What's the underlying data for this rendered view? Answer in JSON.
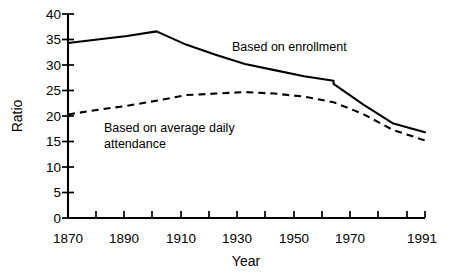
{
  "chart_data": {
    "type": "line",
    "title": "",
    "xlabel": "Year",
    "ylabel": "Ratio",
    "xlim": [
      1870,
      1991
    ],
    "ylim": [
      0,
      40
    ],
    "grid": false,
    "legend_position": "inline-annotations",
    "x_ticks_labeled": [
      "1870",
      "1890",
      "1910",
      "1930",
      "1950",
      "1970",
      "1991"
    ],
    "x_tick_values": [
      1870,
      1890,
      1910,
      1930,
      1950,
      1970,
      1991
    ],
    "x_minor_tick_values": [
      1880,
      1900,
      1920,
      1940,
      1960,
      1980
    ],
    "y_ticks": [
      "0",
      "5",
      "10",
      "15",
      "20",
      "25",
      "30",
      "35",
      "40"
    ],
    "y_tick_values": [
      0,
      5,
      10,
      15,
      20,
      25,
      30,
      35,
      40
    ],
    "series": [
      {
        "name": "Based on enrollment",
        "style": "solid",
        "color": "#000000",
        "x": [
          1870,
          1880,
          1890,
          1900,
          1910,
          1920,
          1930,
          1940,
          1950,
          1960,
          1960,
          1970,
          1980,
          1991
        ],
        "values": [
          34.3,
          35.0,
          35.7,
          36.6,
          34.0,
          32.0,
          30.2,
          29.0,
          27.8,
          26.9,
          26.3,
          22.3,
          18.6,
          16.8
        ]
      },
      {
        "name": "Based on average daily attendance",
        "style": "dashed",
        "color": "#000000",
        "x": [
          1870,
          1880,
          1890,
          1900,
          1910,
          1920,
          1930,
          1940,
          1950,
          1960,
          1970,
          1980,
          1991
        ],
        "values": [
          20.3,
          21.2,
          22.0,
          23.0,
          24.1,
          24.4,
          24.7,
          24.4,
          23.8,
          22.7,
          20.4,
          17.3,
          15.2
        ]
      }
    ],
    "annotations": [
      {
        "id": "enrollment-label",
        "text": "Based on enrollment",
        "x": 1980,
        "y": 34.5
      },
      {
        "id": "ada-label-line1",
        "text": "Based on average daily",
        "x": 1905,
        "y": 18.5
      },
      {
        "id": "ada-label-line2",
        "text": "attendance",
        "x": 1905,
        "y": 16.0
      }
    ]
  },
  "axes": {
    "y_axis_title": "Ratio",
    "x_axis_title": "Year"
  },
  "annotations": {
    "enrollment": "Based on enrollment",
    "ada_line1": "Based on average daily",
    "ada_line2": "attendance"
  },
  "y_labels": [
    "40",
    "35",
    "30",
    "25",
    "20",
    "15",
    "10",
    "5",
    "0"
  ],
  "x_labels": [
    "1870",
    "1890",
    "1910",
    "1930",
    "1950",
    "1970",
    "1991"
  ]
}
